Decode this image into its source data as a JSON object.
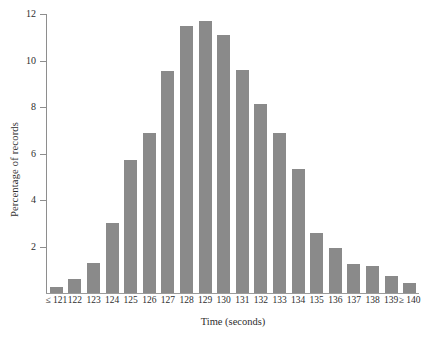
{
  "chart_data": {
    "type": "bar",
    "title": "",
    "xlabel": "Time (seconds)",
    "ylabel": "Percentage of records",
    "ylim": [
      0,
      12
    ],
    "yticks": [
      0,
      2,
      4,
      6,
      8,
      10,
      12
    ],
    "ytick_labels": [
      "",
      "2",
      "4",
      "6",
      "8",
      "10",
      "12"
    ],
    "grid": false,
    "legend": null,
    "bar_color": "#8a8a8a",
    "categories": [
      "≤ 121",
      "122",
      "123",
      "124",
      "125",
      "126",
      "127",
      "128",
      "129",
      "130",
      "131",
      "132",
      "133",
      "134",
      "135",
      "136",
      "137",
      "138",
      "139",
      "≥ 140"
    ],
    "values": [
      0.25,
      0.6,
      1.3,
      3.0,
      5.7,
      6.9,
      9.55,
      11.5,
      11.7,
      11.1,
      9.6,
      8.15,
      6.9,
      5.35,
      2.6,
      1.95,
      1.25,
      1.15,
      0.75,
      0.45
    ]
  }
}
